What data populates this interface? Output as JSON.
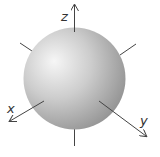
{
  "diagram": {
    "type": "3d-coordinate-sphere",
    "sphere": {
      "cx": 74.5,
      "cy": 78.5,
      "r": 51,
      "color_light": "#f4f4f4",
      "color_mid": "#c4c4c4",
      "color_dark": "#8e8e8e"
    },
    "axes": [
      {
        "label": "z",
        "direction": "up"
      },
      {
        "label": "x",
        "direction": "down-left"
      },
      {
        "label": "y",
        "direction": "down-right"
      }
    ],
    "line_color": "#444444"
  }
}
